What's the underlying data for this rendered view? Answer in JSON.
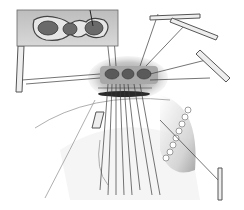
{
  "illustration": {
    "subject": "surgical line illustration with inset close-up of three-chambered opening and retracted sutures",
    "colors": {
      "background": "#ffffff",
      "ink": "#3a3a3a",
      "shade_dark": "#555555",
      "shade_mid": "#9a9a9a",
      "shade_light": "#d8d8d8"
    },
    "inset": {
      "x": 17,
      "y": 10,
      "w": 101,
      "h": 36
    },
    "sutures_count": 14,
    "instruments": [
      "clamp-top-right",
      "clamp-right",
      "clamp-bottom-right",
      "retractor-left"
    ]
  }
}
